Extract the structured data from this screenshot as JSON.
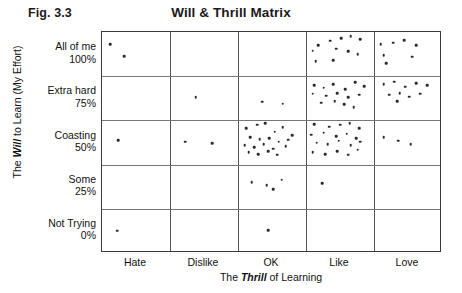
{
  "figure_label": "Fig. 3.3",
  "title": "Will & Thrill Matrix",
  "axis": {
    "y_title_pre": "The ",
    "y_title_em": "Will",
    "y_title_post": " to Learn (My Effort)",
    "x_title_pre": "The ",
    "x_title_em": "Thrill",
    "x_title_post": " of Learning"
  },
  "chart_data": {
    "type": "scatter",
    "title": "Will & Thrill Matrix",
    "xlabel": "The Thrill of Learning",
    "ylabel": "The Will to Learn (My Effort)",
    "grid": true,
    "legend": "none",
    "x_categories": [
      "Hate",
      "Dislike",
      "OK",
      "Like",
      "Love"
    ],
    "y_categories": [
      "All of me",
      "Extra hard",
      "Coasting",
      "Some",
      "Not Trying"
    ],
    "y_percent_labels": [
      "100%",
      "75%",
      "50%",
      "25%",
      "0%"
    ],
    "cell_counts": [
      {
        "x": "Hate",
        "y": "All of me",
        "n": 2
      },
      {
        "x": "Hate",
        "y": "Extra hard",
        "n": 0
      },
      {
        "x": "Hate",
        "y": "Coasting",
        "n": 1
      },
      {
        "x": "Hate",
        "y": "Some",
        "n": 0
      },
      {
        "x": "Hate",
        "y": "Not Trying",
        "n": 1
      },
      {
        "x": "Dislike",
        "y": "All of me",
        "n": 0
      },
      {
        "x": "Dislike",
        "y": "Extra hard",
        "n": 1
      },
      {
        "x": "Dislike",
        "y": "Coasting",
        "n": 2
      },
      {
        "x": "Dislike",
        "y": "Some",
        "n": 0
      },
      {
        "x": "Dislike",
        "y": "Not Trying",
        "n": 0
      },
      {
        "x": "OK",
        "y": "All of me",
        "n": 0
      },
      {
        "x": "OK",
        "y": "Extra hard",
        "n": 2
      },
      {
        "x": "OK",
        "y": "Coasting",
        "n": 20
      },
      {
        "x": "OK",
        "y": "Some",
        "n": 4
      },
      {
        "x": "OK",
        "y": "Not Trying",
        "n": 1
      },
      {
        "x": "Like",
        "y": "All of me",
        "n": 11
      },
      {
        "x": "Like",
        "y": "Extra hard",
        "n": 15
      },
      {
        "x": "Like",
        "y": "Coasting",
        "n": 20
      },
      {
        "x": "Like",
        "y": "Some",
        "n": 1
      },
      {
        "x": "Like",
        "y": "Not Trying",
        "n": 0
      },
      {
        "x": "Love",
        "y": "All of me",
        "n": 7
      },
      {
        "x": "Love",
        "y": "Extra hard",
        "n": 10
      },
      {
        "x": "Love",
        "y": "Coasting",
        "n": 3
      },
      {
        "x": "Love",
        "y": "Some",
        "n": 0
      },
      {
        "x": "Love",
        "y": "Not Trying",
        "n": 0
      }
    ],
    "points": [
      [
        0.12,
        4.72
      ],
      [
        0.33,
        4.45
      ],
      [
        0.24,
        2.55
      ],
      [
        0.22,
        0.5
      ],
      [
        1.38,
        3.52
      ],
      [
        1.22,
        2.52
      ],
      [
        1.62,
        2.48
      ],
      [
        2.36,
        3.42
      ],
      [
        2.66,
        3.38
      ],
      [
        2.12,
        2.82
      ],
      [
        2.28,
        2.9
      ],
      [
        2.4,
        2.94
      ],
      [
        2.54,
        2.74
      ],
      [
        2.66,
        2.84
      ],
      [
        2.18,
        2.62
      ],
      [
        2.32,
        2.58
      ],
      [
        2.46,
        2.6
      ],
      [
        2.6,
        2.52
      ],
      [
        2.74,
        2.56
      ],
      [
        2.1,
        2.44
      ],
      [
        2.24,
        2.4
      ],
      [
        2.38,
        2.46
      ],
      [
        2.52,
        2.36
      ],
      [
        2.7,
        2.42
      ],
      [
        2.16,
        2.28
      ],
      [
        2.3,
        2.24
      ],
      [
        2.44,
        2.3
      ],
      [
        2.58,
        2.22
      ],
      [
        2.8,
        2.66
      ],
      [
        2.2,
        1.6
      ],
      [
        2.42,
        1.54
      ],
      [
        2.52,
        1.44
      ],
      [
        2.64,
        1.66
      ],
      [
        2.44,
        0.52
      ],
      [
        3.18,
        4.7
      ],
      [
        3.36,
        4.8
      ],
      [
        3.52,
        4.86
      ],
      [
        3.66,
        4.9
      ],
      [
        3.8,
        4.84
      ],
      [
        3.1,
        4.58
      ],
      [
        3.44,
        4.62
      ],
      [
        3.62,
        4.56
      ],
      [
        3.76,
        4.5
      ],
      [
        3.14,
        4.34
      ],
      [
        3.4,
        4.36
      ],
      [
        3.12,
        3.8
      ],
      [
        3.26,
        3.74
      ],
      [
        3.4,
        3.82
      ],
      [
        3.58,
        3.7
      ],
      [
        3.72,
        3.86
      ],
      [
        3.86,
        3.78
      ],
      [
        3.1,
        3.6
      ],
      [
        3.3,
        3.56
      ],
      [
        3.46,
        3.62
      ],
      [
        3.62,
        3.52
      ],
      [
        3.78,
        3.58
      ],
      [
        3.22,
        3.4
      ],
      [
        3.42,
        3.44
      ],
      [
        3.56,
        3.36
      ],
      [
        3.7,
        3.3
      ],
      [
        3.12,
        2.92
      ],
      [
        3.34,
        2.86
      ],
      [
        3.5,
        2.9
      ],
      [
        3.64,
        2.94
      ],
      [
        3.78,
        2.82
      ],
      [
        3.08,
        2.68
      ],
      [
        3.26,
        2.72
      ],
      [
        3.44,
        2.64
      ],
      [
        3.6,
        2.7
      ],
      [
        3.74,
        2.6
      ],
      [
        3.16,
        2.5
      ],
      [
        3.32,
        2.46
      ],
      [
        3.48,
        2.54
      ],
      [
        3.66,
        2.44
      ],
      [
        3.8,
        2.52
      ],
      [
        3.1,
        2.28
      ],
      [
        3.28,
        2.24
      ],
      [
        3.46,
        2.3
      ],
      [
        3.62,
        2.22
      ],
      [
        3.76,
        2.34
      ],
      [
        3.24,
        1.58
      ],
      [
        4.1,
        4.72
      ],
      [
        4.28,
        4.76
      ],
      [
        4.44,
        4.82
      ],
      [
        4.62,
        4.7
      ],
      [
        4.14,
        4.48
      ],
      [
        4.56,
        4.44
      ],
      [
        4.18,
        4.3
      ],
      [
        4.14,
        3.82
      ],
      [
        4.3,
        3.88
      ],
      [
        4.46,
        3.76
      ],
      [
        4.62,
        3.84
      ],
      [
        4.78,
        3.8
      ],
      [
        4.22,
        3.58
      ],
      [
        4.38,
        3.62
      ],
      [
        4.52,
        3.54
      ],
      [
        4.68,
        3.6
      ],
      [
        4.34,
        3.44
      ],
      [
        4.14,
        2.62
      ],
      [
        4.36,
        2.54
      ],
      [
        4.54,
        2.46
      ]
    ]
  }
}
